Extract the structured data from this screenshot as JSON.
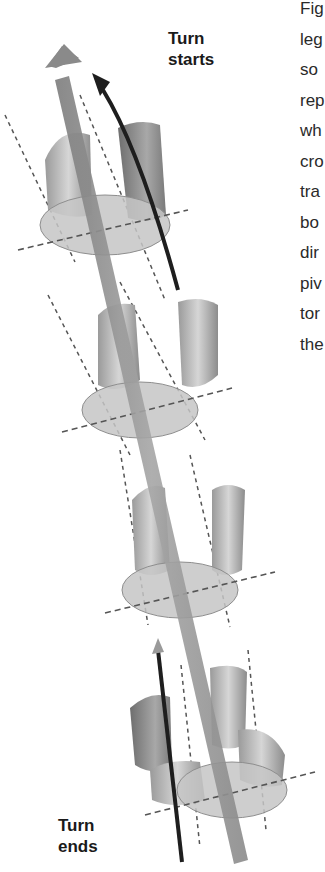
{
  "figure": {
    "labels": {
      "turn_starts": [
        "Turn",
        "starts"
      ],
      "turn_ends": [
        "Turn",
        "ends"
      ]
    },
    "side_text_fragments": [
      "Fig",
      "leg",
      "so",
      "rep",
      "wh",
      "cro",
      "tra",
      "bo",
      "dir",
      "piv",
      "tor",
      "the"
    ],
    "colors": {
      "main_arrow": "#8a8a8a",
      "curved_arrow": "#1e1e1e",
      "foot": "#b4b4b4",
      "disk": "#c8c8c8",
      "dashed": "#555555"
    },
    "foot_poses": 4
  }
}
